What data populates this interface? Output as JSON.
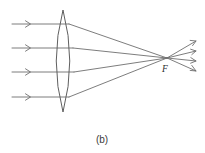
{
  "figure": {
    "caption": "(b)",
    "focal_point_label": "F",
    "background_color": "#ffffff",
    "stroke_color": "#6e6e6e",
    "lens_stroke_color": "#5f5f5f",
    "text_color": "#2b2b2b",
    "width": 205,
    "height": 153
  },
  "lens": {
    "name": "biconvex-converging-lens",
    "apex_top": {
      "x": 63,
      "y": 10
    },
    "apex_bottom": {
      "x": 63,
      "y": 112
    },
    "left_bulge_x": 51,
    "right_bulge_x": 76,
    "center_y": 61
  },
  "focal_point": {
    "label": "F",
    "x": 167,
    "y": 58,
    "label_x": 165,
    "label_y": 72
  },
  "incoming_rays": [
    {
      "id": "incoming-ray-1",
      "x_start": 12,
      "x_end": 69,
      "y": 24,
      "arrow_x": 30
    },
    {
      "id": "incoming-ray-2",
      "x_start": 12,
      "x_end": 73,
      "y": 48,
      "arrow_x": 30
    },
    {
      "id": "incoming-ray-3",
      "x_start": 12,
      "x_end": 74,
      "y": 72,
      "arrow_x": 30
    },
    {
      "id": "incoming-ray-4",
      "x_start": 12,
      "x_end": 69,
      "y": 97,
      "arrow_x": 30
    }
  ],
  "refracted_rays": [
    {
      "id": "refracted-ray-1",
      "x_start": 69,
      "y_start": 24,
      "x_end": 167,
      "y_end": 58
    },
    {
      "id": "refracted-ray-2",
      "x_start": 73,
      "y_start": 48,
      "x_end": 167,
      "y_end": 58
    },
    {
      "id": "refracted-ray-3",
      "x_start": 74,
      "y_start": 72,
      "x_end": 167,
      "y_end": 58
    },
    {
      "id": "refracted-ray-4",
      "x_start": 69,
      "y_start": 97,
      "x_end": 167,
      "y_end": 58
    }
  ],
  "diverging_rays": [
    {
      "id": "diverging-ray-1",
      "x_start": 167,
      "y_start": 58,
      "x_end": 196,
      "y_end": 41,
      "arrow_x": 196,
      "arrow_y": 41
    },
    {
      "id": "diverging-ray-2",
      "x_start": 167,
      "y_start": 58,
      "x_end": 196,
      "y_end": 51,
      "arrow_x": 196,
      "arrow_y": 51
    },
    {
      "id": "diverging-ray-3",
      "x_start": 167,
      "y_start": 58,
      "x_end": 196,
      "y_end": 61,
      "arrow_x": 196,
      "arrow_y": 61
    },
    {
      "id": "diverging-ray-4",
      "x_start": 167,
      "y_start": 58,
      "x_end": 196,
      "y_end": 71,
      "arrow_x": 196,
      "arrow_y": 71
    }
  ],
  "caption": {
    "text": "(b)",
    "x": 102,
    "y": 143
  }
}
